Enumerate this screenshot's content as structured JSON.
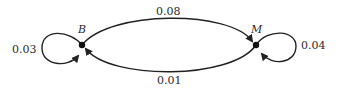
{
  "diagram": {
    "type": "state-transition",
    "nodes": [
      {
        "id": "B",
        "label": "B"
      },
      {
        "id": "M",
        "label": "M"
      }
    ],
    "edges": [
      {
        "from": "B",
        "to": "B",
        "label": "0.03"
      },
      {
        "from": "B",
        "to": "M",
        "label": "0.08"
      },
      {
        "from": "M",
        "to": "B",
        "label": "0.01"
      },
      {
        "from": "M",
        "to": "M",
        "label": "0.04"
      }
    ]
  }
}
